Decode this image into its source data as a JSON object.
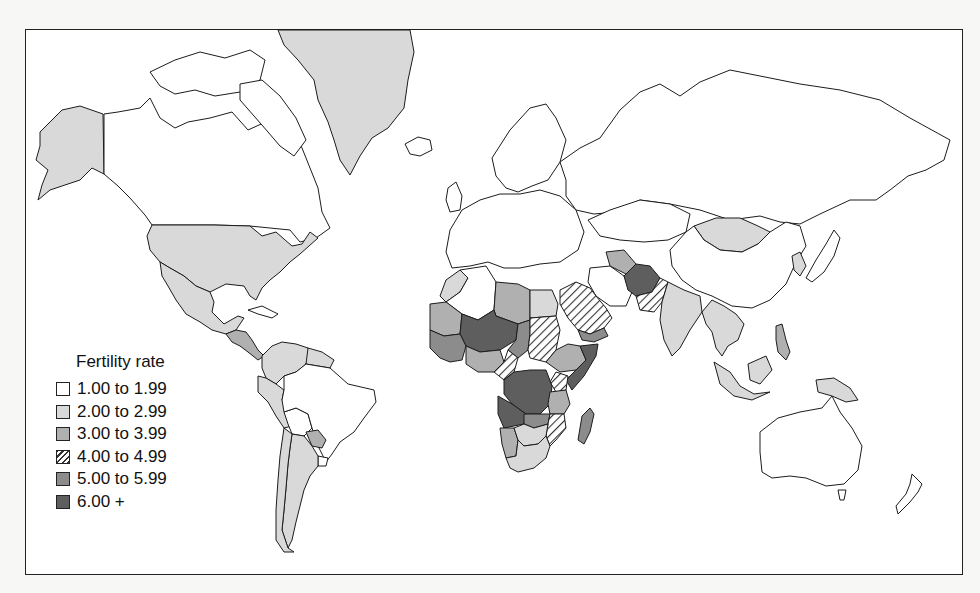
{
  "map": {
    "title": "Fertility rate",
    "stroke_color": "#1c1c1c",
    "frame_color": "#222222"
  },
  "legend": {
    "title": "Fertility rate",
    "classes": [
      {
        "id": "c1",
        "label": "1.00 to 1.99",
        "fill": "#ffffff",
        "pattern": "none"
      },
      {
        "id": "c2",
        "label": "2.00 to 2.99",
        "fill": "#d9d9d9",
        "pattern": "none"
      },
      {
        "id": "c3",
        "label": "3.00 to 3.99",
        "fill": "#b0b0b0",
        "pattern": "none"
      },
      {
        "id": "c4",
        "label": "4.00 to 4.99",
        "fill": "#ffffff",
        "pattern": "diagonal-hatch"
      },
      {
        "id": "c5",
        "label": "5.00 to 5.99",
        "fill": "#8c8c8c",
        "pattern": "none"
      },
      {
        "id": "c6",
        "label": "6.00 +",
        "fill": "#5e5e5e",
        "pattern": "none"
      }
    ]
  },
  "regions": [
    {
      "name": "alaska",
      "class": "c2"
    },
    {
      "name": "canada",
      "class": "c1"
    },
    {
      "name": "greenland",
      "class": "c2"
    },
    {
      "name": "iceland",
      "class": "c1"
    },
    {
      "name": "usa",
      "class": "c2"
    },
    {
      "name": "mexico",
      "class": "c2"
    },
    {
      "name": "central-america",
      "class": "c3"
    },
    {
      "name": "cuba",
      "class": "c1"
    },
    {
      "name": "colombia-venezuela",
      "class": "c2"
    },
    {
      "name": "guianas",
      "class": "c2"
    },
    {
      "name": "peru-ecuador",
      "class": "c2"
    },
    {
      "name": "bolivia",
      "class": "c1"
    },
    {
      "name": "brazil",
      "class": "c1"
    },
    {
      "name": "paraguay",
      "class": "c3"
    },
    {
      "name": "chile",
      "class": "c2"
    },
    {
      "name": "argentina",
      "class": "c2"
    },
    {
      "name": "uruguay",
      "class": "c1"
    },
    {
      "name": "europe",
      "class": "c1"
    },
    {
      "name": "scandinavia",
      "class": "c1"
    },
    {
      "name": "russia",
      "class": "c1"
    },
    {
      "name": "kazakhstan",
      "class": "c1"
    },
    {
      "name": "mongolia",
      "class": "c2"
    },
    {
      "name": "china",
      "class": "c1"
    },
    {
      "name": "japan",
      "class": "c1"
    },
    {
      "name": "korea",
      "class": "c2"
    },
    {
      "name": "morocco",
      "class": "c2"
    },
    {
      "name": "algeria",
      "class": "c1"
    },
    {
      "name": "libya",
      "class": "c3"
    },
    {
      "name": "egypt",
      "class": "c2"
    },
    {
      "name": "mauritania",
      "class": "c3"
    },
    {
      "name": "mali-niger",
      "class": "c6"
    },
    {
      "name": "chad",
      "class": "c5"
    },
    {
      "name": "sudan",
      "class": "c4"
    },
    {
      "name": "west-africa",
      "class": "c5"
    },
    {
      "name": "nigeria",
      "class": "c3"
    },
    {
      "name": "cameroon",
      "class": "c4"
    },
    {
      "name": "ethiopia",
      "class": "c3"
    },
    {
      "name": "somalia",
      "class": "c6"
    },
    {
      "name": "congo-drc",
      "class": "c6"
    },
    {
      "name": "kenya-tanzania",
      "class": "c3"
    },
    {
      "name": "east-africa-hatch",
      "class": "c4"
    },
    {
      "name": "angola",
      "class": "c6"
    },
    {
      "name": "zambia",
      "class": "c5"
    },
    {
      "name": "mozambique",
      "class": "c4"
    },
    {
      "name": "namibia",
      "class": "c3"
    },
    {
      "name": "botswana-zimbabwe",
      "class": "c2"
    },
    {
      "name": "south-africa",
      "class": "c2"
    },
    {
      "name": "madagascar",
      "class": "c5"
    },
    {
      "name": "arabian-peninsula",
      "class": "c4"
    },
    {
      "name": "yemen",
      "class": "c5"
    },
    {
      "name": "iran",
      "class": "c1"
    },
    {
      "name": "turkmenistan",
      "class": "c3"
    },
    {
      "name": "afghanistan",
      "class": "c6"
    },
    {
      "name": "pakistan",
      "class": "c4"
    },
    {
      "name": "india",
      "class": "c2"
    },
    {
      "name": "southeast-asia",
      "class": "c2"
    },
    {
      "name": "philippines",
      "class": "c3"
    },
    {
      "name": "indonesia",
      "class": "c2"
    },
    {
      "name": "papua-new-guinea",
      "class": "c2"
    },
    {
      "name": "australia",
      "class": "c1"
    },
    {
      "name": "new-zealand",
      "class": "c1"
    }
  ]
}
